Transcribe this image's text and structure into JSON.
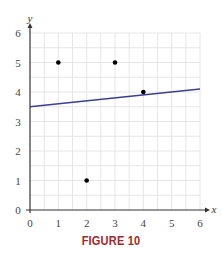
{
  "chart_data": {
    "type": "scatter",
    "title": "",
    "caption": "FIGURE 10",
    "xlabel": "x",
    "ylabel": "y",
    "xlim": [
      0,
      6
    ],
    "ylim": [
      0,
      6
    ],
    "xticks": [
      "0",
      "1",
      "2",
      "3",
      "4",
      "5",
      "6"
    ],
    "yticks": [
      "0",
      "1",
      "2",
      "3",
      "4",
      "5",
      "6"
    ],
    "grid": true,
    "grid_step": 0.5,
    "points": [
      {
        "x": 1,
        "y": 5
      },
      {
        "x": 2,
        "y": 1
      },
      {
        "x": 3,
        "y": 5
      },
      {
        "x": 4,
        "y": 4
      }
    ],
    "line": {
      "slope": 0.1,
      "intercept": 3.5,
      "x_start": 0,
      "x_end": 6,
      "label": "least-squares line"
    },
    "colors": {
      "line": "#3b3f8f",
      "points": "#000000",
      "grid": "#e6e6e6",
      "axis": "#333333",
      "caption": "#a3282d"
    }
  }
}
